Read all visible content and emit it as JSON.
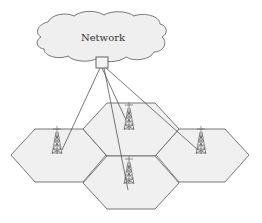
{
  "diagram": {
    "type": "cellular-network",
    "cloud": {
      "label": "Network"
    },
    "gateway": {
      "name": "network-gateway"
    },
    "cells": [
      {
        "id": "cell-left",
        "has_tower": true
      },
      {
        "id": "cell-top-center",
        "has_tower": true
      },
      {
        "id": "cell-bottom-center",
        "has_tower": true
      },
      {
        "id": "cell-right",
        "has_tower": true
      }
    ],
    "links": [
      {
        "from": "gateway",
        "to": "cell-left"
      },
      {
        "from": "gateway",
        "to": "cell-top-center"
      },
      {
        "from": "gateway",
        "to": "cell-bottom-center"
      },
      {
        "from": "gateway",
        "to": "cell-right"
      }
    ],
    "colors": {
      "cell_fill": "#f0f0f0",
      "stroke": "#6a6a6a"
    }
  }
}
